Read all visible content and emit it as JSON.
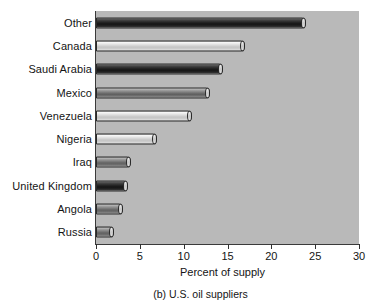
{
  "chart_data": {
    "type": "bar",
    "orientation": "horizontal",
    "title": "",
    "caption": "(b) U.S. oil suppliers",
    "xlabel": "Percent of supply",
    "ylabel": "",
    "xlim": [
      0,
      30
    ],
    "xticks": [
      0,
      5,
      10,
      15,
      20,
      25,
      30
    ],
    "xtick_labels": [
      "0",
      "5",
      "10",
      "15",
      "20",
      "25",
      "30"
    ],
    "grid": false,
    "legend": null,
    "plot_background": "#b9b9b9",
    "categories": [
      "Other",
      "Canada",
      "Saudi Arabia",
      "Mexico",
      "Venezuela",
      "Nigeria",
      "Iraq",
      "United Kingdom",
      "Angola",
      "Russia"
    ],
    "values": [
      24.0,
      17.0,
      14.5,
      13.0,
      11.0,
      7.0,
      4.0,
      3.7,
      3.1,
      2.1
    ],
    "bar_shades": [
      "dark",
      "light",
      "dark",
      "mid",
      "light",
      "light",
      "mid",
      "dark",
      "mid",
      "mid"
    ]
  }
}
